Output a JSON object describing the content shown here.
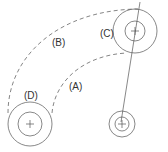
{
  "diagram": {
    "labels": {
      "a": "(A)",
      "b": "(B)",
      "c": "(C)",
      "d": "(D)"
    },
    "colors": {
      "line": "#555555",
      "dashed": "#666666",
      "text": "#333333",
      "background": "#ffffff"
    },
    "circles": [
      {
        "id": "C",
        "cx": 135,
        "cy": 31,
        "outer_r": 22,
        "inner_r": 10
      },
      {
        "id": "D",
        "cx": 30,
        "cy": 124,
        "outer_r": 22,
        "inner_r": 12
      },
      {
        "id": "E",
        "cx": 122,
        "cy": 124,
        "outer_r": 13,
        "inner_r": 7
      }
    ],
    "paths": {
      "arc_b": "dashed outer arc from D to C",
      "arc_a": "dashed inner arc from D to C",
      "connecting_line": "solid line through C down to bottom-right circle"
    }
  }
}
